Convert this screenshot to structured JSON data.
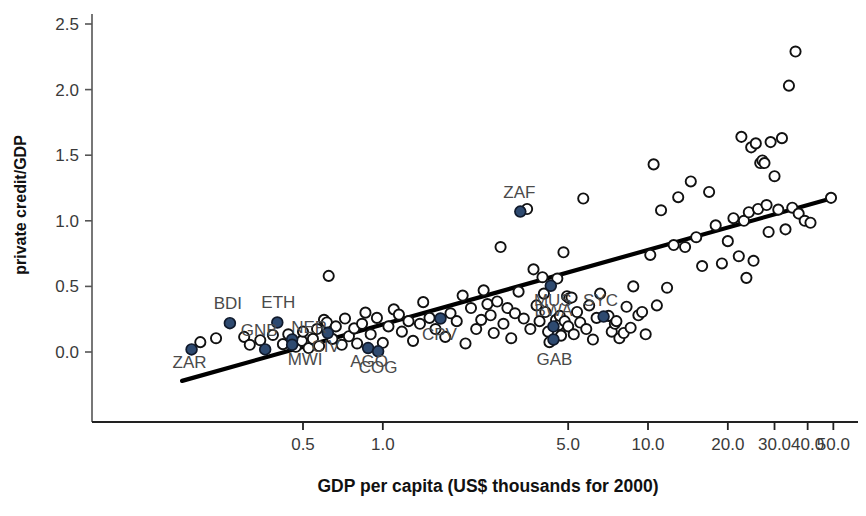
{
  "chart_data": {
    "type": "scatter",
    "title": "",
    "xlabel": "GDP per capita (US$ thousands for 2000)",
    "ylabel": "private credit/GDP",
    "xscale": "log",
    "yscale": "linear",
    "xticks": [
      0.5,
      1.0,
      5.0,
      10.0,
      20.0,
      30.0,
      40.0,
      50.0
    ],
    "xticklabels": [
      "0.5",
      "1.0",
      "5.0",
      "10.0",
      "20.0",
      "30.0",
      "40.0",
      "50.0"
    ],
    "yticks": [
      0.0,
      0.5,
      1.0,
      1.5,
      2.0,
      2.5
    ],
    "yticklabels": [
      "0.0",
      "0.5",
      "1.0",
      "1.5",
      "2.0",
      "2.5"
    ],
    "xlim": [
      0.16,
      55.0
    ],
    "ylim": [
      -0.32,
      2.62
    ],
    "grid": false,
    "legend": "none",
    "marker_colors": {
      "highlighted_fill": "#2e4a70",
      "highlighted_edge": "#101a2c",
      "other_fill": "#ffffff",
      "other_edge": "#111111",
      "fit_line": "#000000",
      "axis": "#555555",
      "tick_label": "#3a3a3a",
      "point_label": "#4a4a4a",
      "axis_title": "#111111"
    },
    "fit_line": {
      "label": "linear fit (log x)",
      "x_start": 0.175,
      "y_start": -0.22,
      "x_end": 49.0,
      "y_end": 1.17
    },
    "labeled_points": [
      {
        "code": "ZAR",
        "x": 0.19,
        "y": 0.02,
        "label_dx": -2,
        "label_dy": 19
      },
      {
        "code": "BDI",
        "x": 0.265,
        "y": 0.22,
        "label_dx": -2,
        "label_dy": -14
      },
      {
        "code": "GNB",
        "x": 0.36,
        "y": 0.02,
        "label_dx": -6,
        "label_dy": -13
      },
      {
        "code": "ETH",
        "x": 0.4,
        "y": 0.225,
        "label_dx": 1,
        "label_dy": -14
      },
      {
        "code": "NER",
        "x": 0.455,
        "y": 0.095,
        "label_dx": 17,
        "label_dy": -7
      },
      {
        "code": "MWI",
        "x": 0.455,
        "y": 0.055,
        "label_dx": 13,
        "label_dy": 20
      },
      {
        "code": "CIV",
        "x": 0.62,
        "y": 0.145,
        "label_dx": -2,
        "label_dy": 19
      },
      {
        "code": "AGO",
        "x": 0.88,
        "y": 0.03,
        "label_dx": 1,
        "label_dy": 19
      },
      {
        "code": "COG",
        "x": 0.96,
        "y": 0.005,
        "label_dx": 0,
        "label_dy": 22
      },
      {
        "code": "CPV",
        "x": 1.65,
        "y": 0.255,
        "label_dx": -1,
        "label_dy": 21
      },
      {
        "code": "ZAF",
        "x": 3.3,
        "y": 1.07,
        "label_dx": -1,
        "label_dy": -14
      },
      {
        "code": "MUS",
        "x": 4.3,
        "y": 0.505,
        "label_dx": 2,
        "label_dy": 20
      },
      {
        "code": "BWA",
        "x": 4.4,
        "y": 0.195,
        "label_dx": 0,
        "label_dy": -10
      },
      {
        "code": "GAB",
        "x": 4.4,
        "y": 0.095,
        "label_dx": 1,
        "label_dy": 25
      },
      {
        "code": "SYC",
        "x": 6.8,
        "y": 0.27,
        "label_dx": -3,
        "label_dy": -11
      }
    ],
    "unlabeled_points": [
      {
        "x": 0.205,
        "y": 0.075
      },
      {
        "x": 0.235,
        "y": 0.105
      },
      {
        "x": 0.3,
        "y": 0.115
      },
      {
        "x": 0.315,
        "y": 0.055
      },
      {
        "x": 0.345,
        "y": 0.09
      },
      {
        "x": 0.385,
        "y": 0.13
      },
      {
        "x": 0.42,
        "y": 0.06
      },
      {
        "x": 0.44,
        "y": 0.135
      },
      {
        "x": 0.47,
        "y": 0.04
      },
      {
        "x": 0.495,
        "y": 0.085
      },
      {
        "x": 0.5,
        "y": 0.155
      },
      {
        "x": 0.525,
        "y": 0.03
      },
      {
        "x": 0.545,
        "y": 0.1
      },
      {
        "x": 0.565,
        "y": 0.175
      },
      {
        "x": 0.575,
        "y": 0.045
      },
      {
        "x": 0.6,
        "y": 0.245
      },
      {
        "x": 0.615,
        "y": 0.225
      },
      {
        "x": 0.625,
        "y": 0.58
      },
      {
        "x": 0.645,
        "y": 0.1
      },
      {
        "x": 0.665,
        "y": 0.195
      },
      {
        "x": 0.7,
        "y": 0.055
      },
      {
        "x": 0.72,
        "y": 0.255
      },
      {
        "x": 0.745,
        "y": 0.12
      },
      {
        "x": 0.78,
        "y": 0.18
      },
      {
        "x": 0.8,
        "y": 0.065
      },
      {
        "x": 0.835,
        "y": 0.215
      },
      {
        "x": 0.86,
        "y": 0.3
      },
      {
        "x": 0.9,
        "y": 0.135
      },
      {
        "x": 0.95,
        "y": 0.26
      },
      {
        "x": 1.0,
        "y": 0.07
      },
      {
        "x": 1.05,
        "y": 0.195
      },
      {
        "x": 1.1,
        "y": 0.325
      },
      {
        "x": 1.15,
        "y": 0.285
      },
      {
        "x": 1.18,
        "y": 0.155
      },
      {
        "x": 1.25,
        "y": 0.235
      },
      {
        "x": 1.3,
        "y": 0.085
      },
      {
        "x": 1.38,
        "y": 0.215
      },
      {
        "x": 1.42,
        "y": 0.38
      },
      {
        "x": 1.5,
        "y": 0.26
      },
      {
        "x": 1.58,
        "y": 0.175
      },
      {
        "x": 1.72,
        "y": 0.115
      },
      {
        "x": 1.8,
        "y": 0.295
      },
      {
        "x": 1.9,
        "y": 0.235
      },
      {
        "x": 2.0,
        "y": 0.43
      },
      {
        "x": 2.05,
        "y": 0.065
      },
      {
        "x": 2.15,
        "y": 0.335
      },
      {
        "x": 2.25,
        "y": 0.175
      },
      {
        "x": 2.35,
        "y": 0.245
      },
      {
        "x": 2.4,
        "y": 0.47
      },
      {
        "x": 2.48,
        "y": 0.365
      },
      {
        "x": 2.55,
        "y": 0.28
      },
      {
        "x": 2.62,
        "y": 0.145
      },
      {
        "x": 2.7,
        "y": 0.385
      },
      {
        "x": 2.78,
        "y": 0.8
      },
      {
        "x": 2.85,
        "y": 0.215
      },
      {
        "x": 2.95,
        "y": 0.335
      },
      {
        "x": 3.05,
        "y": 0.105
      },
      {
        "x": 3.15,
        "y": 0.295
      },
      {
        "x": 3.25,
        "y": 0.46
      },
      {
        "x": 3.4,
        "y": 0.255
      },
      {
        "x": 3.5,
        "y": 1.09
      },
      {
        "x": 3.6,
        "y": 0.175
      },
      {
        "x": 3.7,
        "y": 0.63
      },
      {
        "x": 3.8,
        "y": 0.355
      },
      {
        "x": 3.9,
        "y": 0.235
      },
      {
        "x": 4.0,
        "y": 0.57
      },
      {
        "x": 4.05,
        "y": 0.445
      },
      {
        "x": 4.1,
        "y": 0.305
      },
      {
        "x": 4.2,
        "y": 0.155
      },
      {
        "x": 4.25,
        "y": 0.075
      },
      {
        "x": 4.5,
        "y": 0.245
      },
      {
        "x": 4.55,
        "y": 0.56
      },
      {
        "x": 4.6,
        "y": 0.205
      },
      {
        "x": 4.65,
        "y": 0.275
      },
      {
        "x": 4.7,
        "y": 0.125
      },
      {
        "x": 4.8,
        "y": 0.76
      },
      {
        "x": 4.85,
        "y": 0.235
      },
      {
        "x": 4.95,
        "y": 0.425
      },
      {
        "x": 5.0,
        "y": 0.195
      },
      {
        "x": 5.05,
        "y": 0.41
      },
      {
        "x": 5.15,
        "y": 0.415
      },
      {
        "x": 5.25,
        "y": 0.135
      },
      {
        "x": 5.4,
        "y": 0.305
      },
      {
        "x": 5.55,
        "y": 0.225
      },
      {
        "x": 5.7,
        "y": 1.17
      },
      {
        "x": 5.85,
        "y": 0.175
      },
      {
        "x": 6.0,
        "y": 0.355
      },
      {
        "x": 6.2,
        "y": 0.095
      },
      {
        "x": 6.4,
        "y": 0.26
      },
      {
        "x": 6.6,
        "y": 0.445
      },
      {
        "x": 7.1,
        "y": 0.275
      },
      {
        "x": 7.3,
        "y": 0.155
      },
      {
        "x": 7.5,
        "y": 0.215
      },
      {
        "x": 7.6,
        "y": 0.235
      },
      {
        "x": 7.8,
        "y": 0.105
      },
      {
        "x": 8.1,
        "y": 0.145
      },
      {
        "x": 8.3,
        "y": 0.345
      },
      {
        "x": 8.6,
        "y": 0.185
      },
      {
        "x": 8.8,
        "y": 0.5
      },
      {
        "x": 9.2,
        "y": 0.28
      },
      {
        "x": 9.5,
        "y": 0.305
      },
      {
        "x": 9.8,
        "y": 0.135
      },
      {
        "x": 10.2,
        "y": 0.74
      },
      {
        "x": 10.5,
        "y": 1.43
      },
      {
        "x": 10.8,
        "y": 0.355
      },
      {
        "x": 11.2,
        "y": 1.08
      },
      {
        "x": 11.8,
        "y": 0.49
      },
      {
        "x": 12.5,
        "y": 0.815
      },
      {
        "x": 13.0,
        "y": 1.18
      },
      {
        "x": 13.8,
        "y": 0.8
      },
      {
        "x": 14.5,
        "y": 1.3
      },
      {
        "x": 15.2,
        "y": 0.875
      },
      {
        "x": 16.0,
        "y": 0.655
      },
      {
        "x": 17.0,
        "y": 1.22
      },
      {
        "x": 18.0,
        "y": 0.965
      },
      {
        "x": 19.0,
        "y": 0.675
      },
      {
        "x": 20.0,
        "y": 0.845
      },
      {
        "x": 21.0,
        "y": 1.02
      },
      {
        "x": 22.0,
        "y": 0.73
      },
      {
        "x": 22.5,
        "y": 1.64
      },
      {
        "x": 23.0,
        "y": 1.0
      },
      {
        "x": 23.5,
        "y": 0.565
      },
      {
        "x": 24.0,
        "y": 1.065
      },
      {
        "x": 24.5,
        "y": 1.56
      },
      {
        "x": 25.0,
        "y": 0.695
      },
      {
        "x": 25.5,
        "y": 1.59
      },
      {
        "x": 26.0,
        "y": 1.09
      },
      {
        "x": 26.5,
        "y": 1.44
      },
      {
        "x": 27.0,
        "y": 1.46
      },
      {
        "x": 27.5,
        "y": 1.44
      },
      {
        "x": 28.0,
        "y": 1.12
      },
      {
        "x": 28.5,
        "y": 0.915
      },
      {
        "x": 29.0,
        "y": 1.6
      },
      {
        "x": 30.0,
        "y": 1.34
      },
      {
        "x": 31.0,
        "y": 1.085
      },
      {
        "x": 32.0,
        "y": 1.63
      },
      {
        "x": 33.0,
        "y": 0.935
      },
      {
        "x": 34.0,
        "y": 2.03
      },
      {
        "x": 35.0,
        "y": 1.1
      },
      {
        "x": 36.0,
        "y": 2.29
      },
      {
        "x": 37.0,
        "y": 1.055
      },
      {
        "x": 39.0,
        "y": 1.0
      },
      {
        "x": 41.0,
        "y": 0.985
      },
      {
        "x": 49.0,
        "y": 1.175
      }
    ]
  }
}
